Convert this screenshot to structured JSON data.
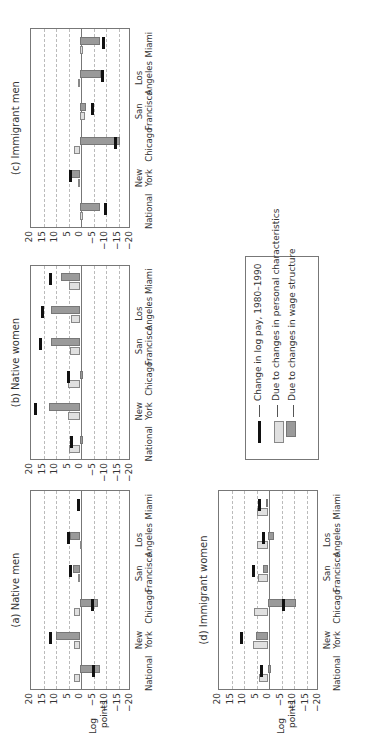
{
  "chart_data": [
    {
      "type": "bar",
      "title": "(a) Native men",
      "ylabel": "Log points",
      "ylim": [
        -20,
        20
      ],
      "yticks": [
        20,
        15,
        10,
        5,
        0,
        -5,
        -10,
        -15,
        -20
      ],
      "categories": [
        "National",
        "New York",
        "Chicago",
        "San Francisco",
        "Los Angeles",
        "Miami"
      ],
      "series": [
        {
          "name": "Due to changes in personal characteristics",
          "values": [
            2.5,
            2.5,
            2.5,
            1.0,
            0.2,
            0.0
          ]
        },
        {
          "name": "Due to changes in wage structure",
          "values": [
            -8.0,
            9.5,
            -7.0,
            2.8,
            4.2,
            1.0
          ]
        },
        {
          "name": "Change in log pay, 1980–1990",
          "values": [
            -5.5,
            12.0,
            -5.0,
            4.0,
            4.5,
            0.8
          ]
        }
      ]
    },
    {
      "type": "bar",
      "title": "(b) Native women",
      "ylim": [
        -20,
        20
      ],
      "yticks": [
        20,
        15,
        10,
        5,
        0,
        -5,
        -10,
        -15,
        -20
      ],
      "categories": [
        "National",
        "New York",
        "Chicago",
        "San Francisco",
        "Los Angeles",
        "Miami"
      ],
      "series": [
        {
          "name": "Due to changes in personal characteristics",
          "values": [
            4.5,
            5.0,
            5.0,
            4.0,
            3.5,
            4.5
          ]
        },
        {
          "name": "Due to changes in wage structure",
          "values": [
            -1.0,
            12.5,
            -1.0,
            11.5,
            11.5,
            7.5
          ]
        },
        {
          "name": "Change in log pay, 1980–1990",
          "values": [
            3.5,
            18.0,
            4.5,
            16.0,
            15.0,
            12.0
          ]
        }
      ]
    },
    {
      "type": "bar",
      "title": "(c) Immigrant men",
      "ylim": [
        -20,
        20
      ],
      "yticks": [
        20,
        15,
        10,
        5,
        0,
        -5,
        -10,
        -15,
        -20
      ],
      "categories": [
        "National",
        "New York",
        "Chicago",
        "San Francisco",
        "Los Angeles",
        "Miami"
      ],
      "series": [
        {
          "name": "Due to changes in personal characteristics",
          "values": [
            -1.0,
            1.0,
            2.5,
            -2.0,
            1.0,
            -1.0
          ]
        },
        {
          "name": "Due to changes in wage structure",
          "values": [
            -8.0,
            3.5,
            -16.0,
            -2.5,
            -8.5,
            -8.0
          ]
        },
        {
          "name": "Change in log pay, 1980–1990",
          "values": [
            -10.0,
            4.0,
            -14.0,
            -5.0,
            -9.0,
            -9.5
          ]
        }
      ]
    },
    {
      "type": "bar",
      "title": "(d) Immigrant women",
      "ylabel": "Log points",
      "ylim": [
        -20,
        20
      ],
      "yticks": [
        20,
        15,
        10,
        5,
        0,
        -5,
        -10,
        -15,
        -20
      ],
      "categories": [
        "National",
        "New York",
        "Chicago",
        "San Francisco",
        "Los Angeles",
        "Miami"
      ],
      "series": [
        {
          "name": "Due to changes in personal characteristics",
          "values": [
            3.5,
            6.0,
            5.5,
            4.0,
            4.5,
            4.5
          ]
        },
        {
          "name": "Due to changes in wage structure",
          "values": [
            -1.0,
            5.0,
            -11.0,
            2.0,
            -2.5,
            1.0
          ]
        },
        {
          "name": "Change in log pay, 1980–1990",
          "values": [
            2.5,
            10.5,
            -6.0,
            6.0,
            2.0,
            3.5
          ]
        }
      ]
    }
  ],
  "panels": {
    "a": {
      "title": "(a) Native men",
      "ylabel_line1": "Log",
      "ylabel_line2": "points"
    },
    "b": {
      "title": "(b) Native women"
    },
    "c": {
      "title": "(c) Immigrant men"
    },
    "d": {
      "title": "(d) Immigrant women",
      "ylabel_line1": "Log",
      "ylabel_line2": "points"
    }
  },
  "axis": {
    "ticks": [
      "20",
      "15",
      "10",
      "5",
      "0",
      "−5",
      "−10",
      "−15",
      "−20"
    ],
    "categories": [
      {
        "line1": "",
        "line2": "National"
      },
      {
        "line1": "New",
        "line2": "York"
      },
      {
        "line1": "",
        "line2": "Chicago"
      },
      {
        "line1": "San",
        "line2": "Francisco"
      },
      {
        "line1": "Los",
        "line2": "Angeles"
      },
      {
        "line1": "",
        "line2": "Miami"
      }
    ]
  },
  "legend": {
    "items": [
      "Change in log pay, 1980–1990",
      "Due to changes in personal characteristics",
      "Due to changes in wage structure"
    ]
  },
  "colors": {
    "personal": "#e0e0e0",
    "wage": "#9a9a9a",
    "change": "#111111"
  }
}
